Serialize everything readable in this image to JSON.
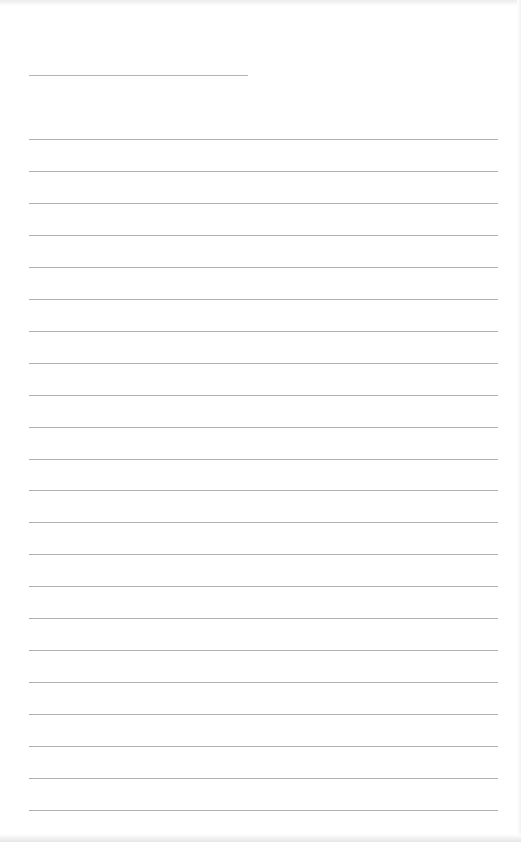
{
  "page": {
    "type": "lined-paper",
    "background_color": "#ffffff",
    "line_color": "#b0b0b0",
    "header_line": {
      "label": "",
      "x": 29,
      "y": 75,
      "width": 219
    },
    "ruled_lines": {
      "count": 22,
      "start_y": 139,
      "spacing": 31.95,
      "x": 29,
      "width": 469
    }
  }
}
